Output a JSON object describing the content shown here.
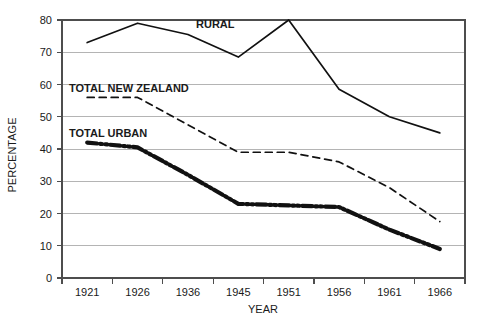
{
  "chart_data": {
    "type": "line",
    "title": "",
    "xlabel": "YEAR",
    "ylabel": "PERCENTAGE",
    "categories": [
      "1921",
      "1926",
      "1936",
      "1945",
      "1951",
      "1956",
      "1961",
      "1966"
    ],
    "x_tick_labels": [
      "1921",
      "1926",
      "1936",
      "1945",
      "1951",
      "1956",
      "1961",
      "1966"
    ],
    "y_tick_labels": [
      "0",
      "10",
      "20",
      "30",
      "40",
      "50",
      "60",
      "70",
      "80"
    ],
    "y_ticks": [
      0,
      10,
      20,
      30,
      40,
      50,
      60,
      70,
      80
    ],
    "ylim": [
      0,
      80
    ],
    "grid": "horizontal",
    "legend_position": "inline-annotations",
    "series": [
      {
        "name": "RURAL",
        "style": "solid",
        "color": "#111111",
        "values": [
          73,
          79,
          75.5,
          68.5,
          80,
          58.5,
          50,
          45
        ],
        "label_x": "1936",
        "label_value": 77.5
      },
      {
        "name": "TOTAL NEW ZEALAND",
        "style": "dashed",
        "color": "#111111",
        "values": [
          56,
          56,
          47.5,
          39,
          39,
          36,
          28,
          17.5
        ],
        "label_x": "1926",
        "label_value": 59
      },
      {
        "name": "TOTAL URBAN",
        "style": "dash-dot-dot",
        "color": "#111111",
        "values": [
          42,
          40.5,
          32,
          23,
          22.5,
          22,
          15,
          9
        ],
        "label_x": "1926",
        "label_value": 46
      }
    ],
    "annotations": [
      {
        "text": "RURAL"
      },
      {
        "text": "TOTAL NEW ZEALAND"
      },
      {
        "text": "TOTAL URBAN"
      }
    ]
  },
  "axes": {
    "x_axis_title": "YEAR",
    "y_axis_title": "PERCENTAGE"
  }
}
